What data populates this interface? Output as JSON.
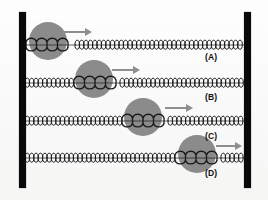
{
  "figure": {
    "background_color": "#fdfdfd",
    "wall_color": "#090909",
    "ball_color": "#8c8c8c",
    "spring_color": "#1a1a1a",
    "arrow_color": "#8f8f8f",
    "label_color": "#111111"
  },
  "walls": [
    {
      "name": "left-wall",
      "x": 19,
      "y": 12,
      "width": 7,
      "height": 176
    },
    {
      "name": "right-wall",
      "x": 244,
      "y": 12,
      "width": 7,
      "height": 176
    }
  ],
  "rows": [
    {
      "label": "(A)",
      "label_x": 205,
      "label_y": 52,
      "spring_y": 45,
      "ball_cx": 48,
      "ball_cy": 41,
      "ball_r": 19,
      "arrow_x": 64,
      "arrow_y": 27,
      "arrow_len": 28,
      "compressed_start": 26,
      "compressed_end": 75,
      "spring_start": 25,
      "spring_end": 246
    },
    {
      "label": "(B)",
      "label_x": 205,
      "label_y": 92,
      "spring_y": 83,
      "ball_cx": 94,
      "ball_cy": 79,
      "ball_r": 19,
      "arrow_x": 112,
      "arrow_y": 65,
      "arrow_len": 28,
      "compressed_start": 74,
      "compressed_end": 120,
      "spring_start": 25,
      "spring_end": 246
    },
    {
      "label": "(C)",
      "label_x": 205,
      "label_y": 131,
      "spring_y": 121,
      "ball_cx": 143,
      "ball_cy": 117,
      "ball_r": 19,
      "arrow_x": 165,
      "arrow_y": 103,
      "arrow_len": 28,
      "compressed_start": 122,
      "compressed_end": 168,
      "spring_start": 25,
      "spring_end": 246
    },
    {
      "label": "(D)",
      "label_x": 205,
      "label_y": 168,
      "spring_y": 158,
      "ball_cx": 197,
      "ball_cy": 154,
      "ball_r": 19,
      "arrow_x": 216,
      "arrow_y": 141,
      "arrow_len": 26,
      "compressed_start": 175,
      "compressed_end": 221,
      "spring_start": 25,
      "spring_end": 246
    }
  ],
  "spring": {
    "coil_pitch": 4.4,
    "coil_amplitude": 6.5,
    "wide_coil_pitch": 10.5,
    "wide_coil_amplitude": 9.0,
    "stroke_width": 1.0
  }
}
